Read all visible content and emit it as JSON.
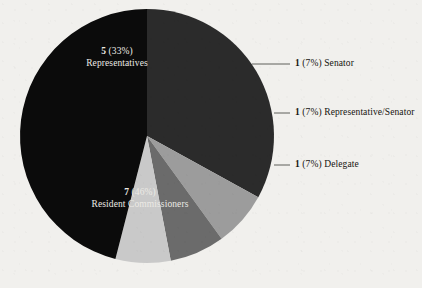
{
  "figure": {
    "background_color": "#f1f0ed",
    "title": ""
  },
  "chart_data": {
    "type": "pie",
    "title": "",
    "xlabel": "",
    "ylabel": "",
    "legend_position": "none",
    "grid": false,
    "total": 15,
    "categories": [
      "Representatives",
      "Senator",
      "Representative/Senator",
      "Delegate",
      "Resident Commissioners"
    ],
    "values": [
      5,
      1,
      1,
      1,
      7
    ],
    "percentages": [
      33,
      7,
      7,
      7,
      46
    ],
    "colors": [
      "#2b2b2b",
      "#9c9c9c",
      "#6b6b6b",
      "#c9c9c9",
      "#0b0b0b"
    ],
    "labels": [
      {
        "value": "5",
        "percent": "(33%)",
        "name": "Representatives",
        "placement": "inside"
      },
      {
        "value": "1",
        "percent": "(7%)",
        "name": "Senator",
        "placement": "callout"
      },
      {
        "value": "1",
        "percent": "(7%)",
        "name": "Representative/Senator",
        "placement": "callout"
      },
      {
        "value": "1",
        "percent": "(7%)",
        "name": "Delegate",
        "placement": "callout"
      },
      {
        "value": "7",
        "percent": "(46%)",
        "name": "Resident Commissioners",
        "placement": "inside"
      }
    ]
  },
  "pie": {
    "center_x": 147,
    "center_y": 136,
    "radius": 127,
    "slices": [
      {
        "id": "representatives",
        "color": "#2b2b2b",
        "start_deg": 0,
        "end_deg": 118.8
      },
      {
        "id": "senator",
        "color": "#9c9c9c",
        "start_deg": 118.8,
        "end_deg": 144.0
      },
      {
        "id": "representative-senator",
        "color": "#6b6b6b",
        "start_deg": 144.0,
        "end_deg": 169.2
      },
      {
        "id": "delegate",
        "color": "#c9c9c9",
        "start_deg": 169.2,
        "end_deg": 194.4
      },
      {
        "id": "resident-commissioners",
        "color": "#0b0b0b",
        "start_deg": 194.4,
        "end_deg": 360
      }
    ]
  },
  "inside_labels": {
    "representatives": {
      "value": "5",
      "percent": "(33%)",
      "name": "Representatives"
    },
    "resident_commissioners": {
      "value": "7",
      "percent": "(46%)",
      "name": "Resident Commissioners"
    }
  },
  "callouts": [
    {
      "id": "senator",
      "value": "1",
      "percent": "(7%)",
      "name": "Senator"
    },
    {
      "id": "representative-senator",
      "value": "1",
      "percent": "(7%)",
      "name": "Representative/Senator"
    },
    {
      "id": "delegate",
      "value": "1",
      "percent": "(7%)",
      "name": "Delegate"
    }
  ],
  "leader_lines": {
    "color": "#3a3a36"
  }
}
